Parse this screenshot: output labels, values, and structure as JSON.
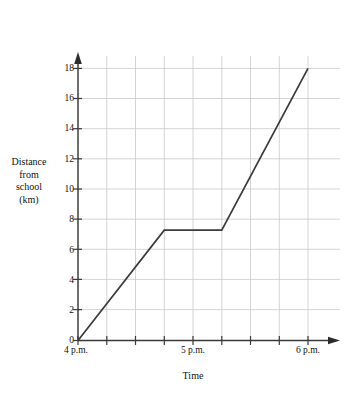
{
  "chart_data": {
    "type": "line",
    "title": "",
    "xlabel": "Time",
    "ylabel_lines": [
      "Distance",
      "from",
      "school",
      "(km)"
    ],
    "ylabel": "Distance from school (km)",
    "grid": true,
    "legend": null,
    "xlim": [
      0,
      120
    ],
    "ylim": [
      0,
      19
    ],
    "x_unit": "minutes after 4 p.m.",
    "y_unit": "km",
    "x_major_ticks": [
      {
        "value": 0,
        "label": "4 p.m."
      },
      {
        "value": 60,
        "label": "5 p.m."
      },
      {
        "value": 120,
        "label": "6 p.m."
      }
    ],
    "x_minor_gridlines": [
      0,
      15,
      30,
      45,
      60,
      75,
      90,
      105,
      120
    ],
    "y_ticks": [
      {
        "value": 0,
        "label": "0"
      },
      {
        "value": 2,
        "label": "2"
      },
      {
        "value": 4,
        "label": "4"
      },
      {
        "value": 6,
        "label": "6"
      },
      {
        "value": 8,
        "label": "8"
      },
      {
        "value": 10,
        "label": "10"
      },
      {
        "value": 12,
        "label": "12"
      },
      {
        "value": 14,
        "label": "14"
      },
      {
        "value": 16,
        "label": "16"
      },
      {
        "value": 18,
        "label": "18"
      }
    ],
    "series": [
      {
        "name": "Distance from school",
        "color": "#3a3a3a",
        "points": [
          {
            "x": 0,
            "y": 0,
            "time": "4 p.m.",
            "distance_km": 0
          },
          {
            "x": 45,
            "y": 7.3,
            "time": "4:45 p.m.",
            "distance_km": 7.3
          },
          {
            "x": 75,
            "y": 7.3,
            "time": "5:15 p.m.",
            "distance_km": 7.3
          },
          {
            "x": 120,
            "y": 18,
            "time": "6 p.m.",
            "distance_km": 18
          }
        ]
      }
    ],
    "colors": {
      "line": "#3a3a3a",
      "axis": "#3a3a3a",
      "grid": "#c8c8c8",
      "background": "#ffffff",
      "text": "#111111"
    }
  }
}
